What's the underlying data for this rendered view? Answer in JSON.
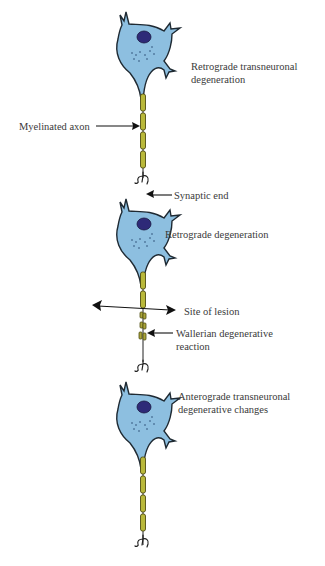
{
  "diagram": {
    "type": "neuron degeneration schematic",
    "labels": {
      "retrograde_transneuronal": [
        "Retrograde transneuronal",
        "degeneration"
      ],
      "myelinated_axon": "Myelinated axon",
      "synaptic_end": "Synaptic end",
      "retrograde_degeneration": "Retrograde degeneration",
      "site_of_lesion": "Site of lesion",
      "wallerian": [
        "Wallerian degenerative",
        "reaction"
      ],
      "anterograde_transneuronal": [
        "Anterograde transneuronal",
        "degenerative changes"
      ]
    },
    "neurons": [
      {
        "name": "upstream-neuron",
        "state": "Retrograde transneuronal degeneration"
      },
      {
        "name": "injured-neuron",
        "state": "Retrograde degeneration"
      },
      {
        "name": "downstream-neuron",
        "state": "Anterograde transneuronal degenerative changes"
      }
    ],
    "colors": {
      "cell_body": "#8dbfe0",
      "nucleus": "#2e2a78",
      "myelin": "#b9b83a",
      "text": "#3a3a3a"
    }
  }
}
